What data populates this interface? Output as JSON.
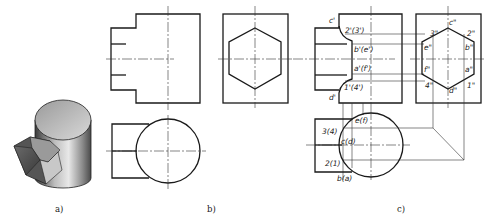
{
  "figure": {
    "captions": {
      "a": "a)",
      "b": "b)",
      "c": "c)"
    },
    "panel_a": {
      "description": "Isometric view: vertical cylinder with a hexagonal prism intersecting its side"
    },
    "panel_b": {
      "description": "Three-view orthographic projection: front view, side view with hexagon, top view with circle"
    },
    "panel_c": {
      "description": "Projection with intersection points labeled",
      "front_labels": [
        "c'",
        "2'(3')",
        "b'(e')",
        "a'(f')",
        "1'(4')",
        "d'"
      ],
      "side_labels": [
        "3\"",
        "c\"",
        "2\"",
        "e\"",
        "b\"",
        "f\"",
        "a\"",
        "4\"",
        "d\"",
        "1\""
      ],
      "top_labels": [
        "e(f)",
        "3(4)",
        "c(d)",
        "2(1)",
        "b(a)"
      ]
    }
  }
}
